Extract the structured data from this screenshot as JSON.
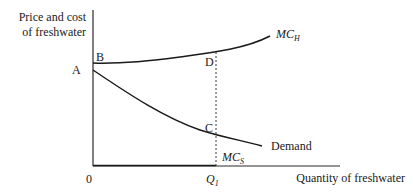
{
  "diagram": {
    "y_axis_label_line1": "Price and cost",
    "y_axis_label_line2": "of freshwater",
    "x_axis_label": "Quantity of freshwater",
    "origin_label": "0",
    "points": {
      "A": "A",
      "B": "B",
      "C": "C",
      "D": "D"
    },
    "quantity_label": {
      "main": "Q",
      "sub": "1"
    },
    "curves": {
      "mc_h": {
        "main": "MC",
        "sub": "H"
      },
      "mc_s": {
        "main": "MC",
        "sub": "S"
      },
      "demand": "Demand"
    }
  }
}
